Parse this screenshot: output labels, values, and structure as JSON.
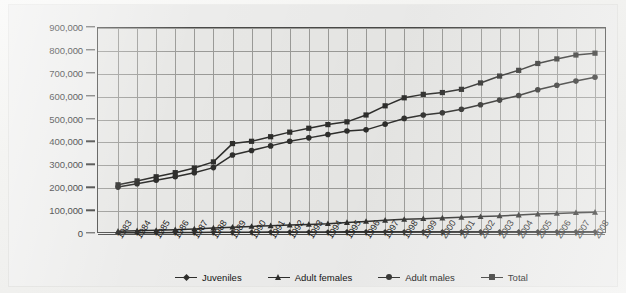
{
  "chart_data": {
    "type": "line",
    "title": "",
    "subtitle": "",
    "xlabel": "",
    "ylabel": "",
    "grid": true,
    "legend_position": "bottom",
    "ylim": [
      0,
      900000
    ],
    "ytick_step": 100000,
    "ytick_labels": [
      "0",
      "100,000",
      "200,000",
      "300,000",
      "400,000",
      "500,000",
      "600,000",
      "700,000",
      "800,000",
      "900,000"
    ],
    "ytick_values": [
      0,
      100000,
      200000,
      300000,
      400000,
      500000,
      600000,
      700000,
      800000,
      900000
    ],
    "categories": [
      "1983",
      "1984",
      "1985",
      "1986",
      "1987",
      "1988",
      "1989",
      "1990",
      "1991",
      "1992",
      "1993",
      "1994",
      "1995",
      "1996",
      "1997",
      "1998",
      "1999",
      "2000",
      "2001",
      "2002",
      "2003",
      "2004",
      "2005",
      "2006",
      "2007",
      "2008"
    ],
    "series": [
      {
        "name": "Juveniles",
        "marker": "diamond",
        "color": "#2e2e2c",
        "values": [
          5000,
          5500,
          6000,
          6500,
          7000,
          7500,
          8000,
          8000,
          8500,
          8500,
          9000,
          9000,
          9500,
          9500,
          9500,
          9500,
          9500,
          9500,
          10000,
          10000,
          10000,
          10000,
          10000,
          10000,
          10000,
          10000
        ]
      },
      {
        "name": "Adult females",
        "marker": "triangle",
        "color": "#2e2e2c",
        "values": [
          12000,
          14000,
          16000,
          19000,
          22000,
          26000,
          30000,
          33000,
          36000,
          39000,
          42000,
          45000,
          50000,
          55000,
          60000,
          64000,
          67000,
          70000,
          73000,
          76000,
          79000,
          83000,
          87000,
          90000,
          93000,
          95000
        ]
      },
      {
        "name": "Adult males",
        "marker": "circle",
        "color": "#2e2e2c",
        "values": [
          205000,
          220000,
          235000,
          250000,
          268000,
          290000,
          345000,
          365000,
          385000,
          405000,
          420000,
          435000,
          450000,
          455000,
          480000,
          505000,
          520000,
          530000,
          545000,
          565000,
          585000,
          605000,
          630000,
          650000,
          668000,
          685000
        ]
      },
      {
        "name": "Total",
        "marker": "square",
        "color": "#2e2e2c",
        "values": [
          215000,
          232000,
          250000,
          268000,
          288000,
          315000,
          395000,
          405000,
          425000,
          445000,
          462000,
          478000,
          490000,
          520000,
          560000,
          595000,
          610000,
          618000,
          632000,
          660000,
          690000,
          715000,
          745000,
          765000,
          782000,
          790000
        ]
      }
    ],
    "legend": [
      "Juveniles",
      "Adult females",
      "Adult males",
      "Total"
    ]
  }
}
